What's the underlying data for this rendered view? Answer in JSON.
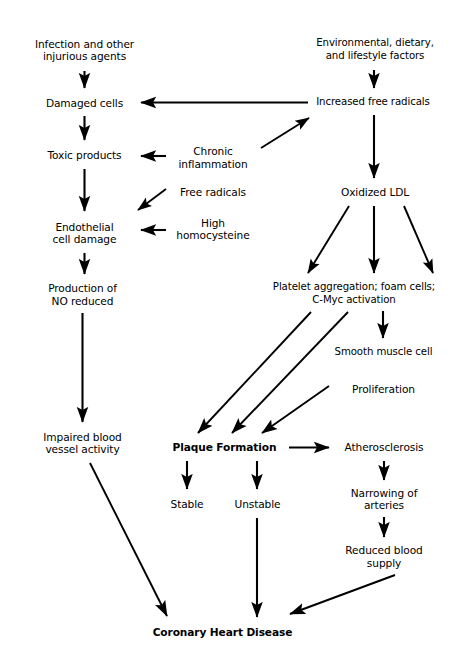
{
  "diagram": {
    "type": "flowchart",
    "background": "#ffffff",
    "box_border_color": "#4a4a4a",
    "arrow_color": "#000000",
    "nodes": [
      {
        "id": "infection",
        "label": "Infection and other\ninjurious agents",
        "bold": false,
        "x": 16,
        "y": 29,
        "w": 137,
        "h": 42
      },
      {
        "id": "damaged_cells",
        "label": "Damaged cells",
        "bold": false,
        "x": 31,
        "y": 90,
        "w": 107,
        "h": 26
      },
      {
        "id": "toxic_products",
        "label": "Toxic products",
        "bold": false,
        "x": 31,
        "y": 142,
        "w": 107,
        "h": 27
      },
      {
        "id": "endothelial",
        "label": "Endothelial\ncell damage",
        "bold": false,
        "x": 31,
        "y": 213,
        "w": 107,
        "h": 40
      },
      {
        "id": "no_reduced",
        "label": "Production of\nNO reduced",
        "bold": false,
        "x": 31,
        "y": 276,
        "w": 103,
        "h": 37
      },
      {
        "id": "impaired",
        "label": "Impaired blood\nvessel activity",
        "bold": false,
        "x": 31,
        "y": 424,
        "w": 103,
        "h": 38
      },
      {
        "id": "chronic_inflam",
        "label": "Chronic\ninflammation",
        "bold": false,
        "x": 167,
        "y": 140,
        "w": 92,
        "h": 35
      },
      {
        "id": "free_radicals",
        "label": "Free radicals",
        "bold": false,
        "x": 167,
        "y": 181,
        "w": 92,
        "h": 23
      },
      {
        "id": "high_homocyst",
        "label": "High\nhomocysteine",
        "bold": false,
        "x": 167,
        "y": 211,
        "w": 92,
        "h": 36
      },
      {
        "id": "environmental",
        "label": "Environmental, dietary,\nand lifestyle factors",
        "bold": false,
        "x": 313,
        "y": 29,
        "w": 124,
        "h": 41
      },
      {
        "id": "increased_fr",
        "label": "Increased free radicals",
        "bold": false,
        "x": 309,
        "y": 90,
        "w": 128,
        "h": 25
      },
      {
        "id": "oxidized_ldl",
        "label": "Oxidized LDL",
        "bold": false,
        "x": 313,
        "y": 180,
        "w": 124,
        "h": 25
      },
      {
        "id": "platelet",
        "label": "Platelet aggregation; foam cells;\nC-Myc activation",
        "bold": false,
        "x": 264,
        "y": 276,
        "w": 180,
        "h": 35
      },
      {
        "id": "smooth_muscle",
        "label": "Smooth muscle cell",
        "bold": false,
        "x": 330,
        "y": 340,
        "w": 107,
        "h": 25
      },
      {
        "id": "proliferation",
        "label": "Proliferation",
        "bold": false,
        "x": 330,
        "y": 377,
        "w": 107,
        "h": 24
      },
      {
        "id": "plaque",
        "label": "Plaque Formation",
        "bold": true,
        "x": 162,
        "y": 435,
        "w": 125,
        "h": 25
      },
      {
        "id": "atherosclerosis",
        "label": "Atherosclerosis",
        "bold": false,
        "x": 331,
        "y": 435,
        "w": 106,
        "h": 25
      },
      {
        "id": "stable",
        "label": "Stable",
        "bold": false,
        "x": 161,
        "y": 491,
        "w": 52,
        "h": 26
      },
      {
        "id": "unstable",
        "label": "Unstable",
        "bold": false,
        "x": 229,
        "y": 491,
        "w": 57,
        "h": 26
      },
      {
        "id": "narrowing",
        "label": "Narrowing of\narteries",
        "bold": false,
        "x": 331,
        "y": 482,
        "w": 106,
        "h": 34
      },
      {
        "id": "reduced_supply",
        "label": "Reduced blood\nsupply",
        "bold": false,
        "x": 331,
        "y": 539,
        "w": 106,
        "h": 35
      },
      {
        "id": "chd",
        "label": "Coronary Heart Disease",
        "bold": true,
        "x": 142,
        "y": 619,
        "w": 161,
        "h": 27
      }
    ],
    "edges": [
      {
        "from": "infection",
        "to": "damaged_cells",
        "kind": "vertical"
      },
      {
        "from": "damaged_cells",
        "to": "toxic_products",
        "kind": "vertical"
      },
      {
        "from": "toxic_products",
        "to": "endothelial",
        "kind": "vertical"
      },
      {
        "from": "endothelial",
        "to": "no_reduced",
        "kind": "vertical"
      },
      {
        "from": "no_reduced",
        "to": "impaired",
        "kind": "vertical"
      },
      {
        "from": "increased_fr",
        "to": "damaged_cells",
        "kind": "horizontal-left"
      },
      {
        "from": "chronic_inflam",
        "to": "toxic_products",
        "kind": "horizontal-left"
      },
      {
        "from": "high_homocyst",
        "to": "endothelial",
        "kind": "horizontal-left"
      },
      {
        "from": "free_radicals",
        "to": "endothelial",
        "kind": "diagonal"
      },
      {
        "from": "chronic_inflam",
        "to": "increased_fr",
        "kind": "diagonal"
      },
      {
        "from": "environmental",
        "to": "increased_fr",
        "kind": "vertical"
      },
      {
        "from": "increased_fr",
        "to": "oxidized_ldl",
        "kind": "vertical"
      },
      {
        "from": "oxidized_ldl",
        "to": "platelet",
        "kind": "fan-three"
      },
      {
        "from": "platelet",
        "to": "smooth_muscle",
        "kind": "vertical"
      },
      {
        "from": "platelet",
        "to": "plaque",
        "kind": "diagonal"
      },
      {
        "from": "smooth_muscle",
        "to": "plaque",
        "kind": "diagonal"
      },
      {
        "from": "proliferation",
        "to": "plaque",
        "kind": "diagonal"
      },
      {
        "from": "plaque",
        "to": "atherosclerosis",
        "kind": "horizontal-right"
      },
      {
        "from": "plaque",
        "to": "stable",
        "kind": "vertical"
      },
      {
        "from": "plaque",
        "to": "unstable",
        "kind": "vertical"
      },
      {
        "from": "atherosclerosis",
        "to": "narrowing",
        "kind": "vertical"
      },
      {
        "from": "narrowing",
        "to": "reduced_supply",
        "kind": "vertical"
      },
      {
        "from": "unstable",
        "to": "chd",
        "kind": "vertical"
      },
      {
        "from": "impaired",
        "to": "chd",
        "kind": "diagonal"
      },
      {
        "from": "reduced_supply",
        "to": "chd",
        "kind": "diagonal"
      }
    ]
  }
}
